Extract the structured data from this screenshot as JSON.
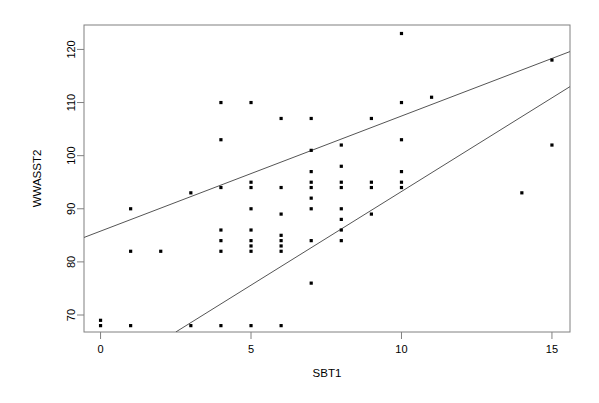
{
  "chart_data": {
    "type": "scatter",
    "title": "",
    "xlabel": "SBT1",
    "ylabel": "WWASST2",
    "xlim": [
      -0.55,
      15.6
    ],
    "ylim": [
      66.8,
      124.6
    ],
    "xticks": [
      0,
      5,
      10,
      15
    ],
    "yticks": [
      70,
      80,
      90,
      100,
      110,
      120
    ],
    "xtick_labels": [
      "0",
      "5",
      "10",
      "15"
    ],
    "ytick_labels": [
      "70",
      "80",
      "90",
      "100",
      "110",
      "120"
    ],
    "grid": false,
    "legend": null,
    "frame": "box",
    "point_symbol": "filled-square-small",
    "point_color": "#000000",
    "line_color": "#555555",
    "x": [
      0,
      0,
      1,
      1,
      1,
      2,
      3,
      3,
      4,
      4,
      4,
      4,
      4,
      4,
      4,
      5,
      5,
      5,
      5,
      5,
      5,
      5,
      5,
      5,
      6,
      6,
      6,
      6,
      6,
      6,
      6,
      6,
      7,
      7,
      7,
      7,
      7,
      7,
      7,
      7,
      7,
      8,
      8,
      8,
      8,
      8,
      8,
      8,
      8,
      9,
      9,
      9,
      9,
      10,
      10,
      10,
      10,
      10,
      10,
      11,
      14,
      15,
      15
    ],
    "y": [
      69,
      68,
      90,
      82,
      68,
      82,
      93,
      68,
      110,
      103,
      94,
      86,
      84,
      82,
      68,
      110,
      95,
      94,
      90,
      86,
      84,
      83,
      82,
      68,
      107,
      94,
      89,
      85,
      84,
      83,
      82,
      68,
      107,
      101,
      97,
      95,
      94,
      92,
      90,
      84,
      76,
      102,
      98,
      95,
      94,
      90,
      88,
      86,
      84,
      107,
      95,
      94,
      89,
      123,
      110,
      103,
      97,
      95,
      94,
      111,
      93,
      118,
      102
    ],
    "series": [
      {
        "name": "points",
        "type": "scatter",
        "points": [
          {
            "x": 0,
            "y": 69
          },
          {
            "x": 0,
            "y": 68
          },
          {
            "x": 1,
            "y": 90
          },
          {
            "x": 1,
            "y": 82
          },
          {
            "x": 1,
            "y": 68
          },
          {
            "x": 2,
            "y": 82
          },
          {
            "x": 3,
            "y": 93
          },
          {
            "x": 3,
            "y": 68
          },
          {
            "x": 4,
            "y": 110
          },
          {
            "x": 4,
            "y": 103
          },
          {
            "x": 4,
            "y": 94
          },
          {
            "x": 4,
            "y": 86
          },
          {
            "x": 4,
            "y": 84
          },
          {
            "x": 4,
            "y": 82
          },
          {
            "x": 4,
            "y": 68
          },
          {
            "x": 5,
            "y": 110
          },
          {
            "x": 5,
            "y": 95
          },
          {
            "x": 5,
            "y": 94
          },
          {
            "x": 5,
            "y": 90
          },
          {
            "x": 5,
            "y": 86
          },
          {
            "x": 5,
            "y": 84
          },
          {
            "x": 5,
            "y": 83
          },
          {
            "x": 5,
            "y": 82
          },
          {
            "x": 5,
            "y": 68
          },
          {
            "x": 6,
            "y": 107
          },
          {
            "x": 6,
            "y": 94
          },
          {
            "x": 6,
            "y": 89
          },
          {
            "x": 6,
            "y": 85
          },
          {
            "x": 6,
            "y": 84
          },
          {
            "x": 6,
            "y": 83
          },
          {
            "x": 6,
            "y": 82
          },
          {
            "x": 6,
            "y": 68
          },
          {
            "x": 7,
            "y": 107
          },
          {
            "x": 7,
            "y": 101
          },
          {
            "x": 7,
            "y": 97
          },
          {
            "x": 7,
            "y": 95
          },
          {
            "x": 7,
            "y": 94
          },
          {
            "x": 7,
            "y": 92
          },
          {
            "x": 7,
            "y": 90
          },
          {
            "x": 7,
            "y": 84
          },
          {
            "x": 7,
            "y": 76
          },
          {
            "x": 8,
            "y": 102
          },
          {
            "x": 8,
            "y": 98
          },
          {
            "x": 8,
            "y": 95
          },
          {
            "x": 8,
            "y": 94
          },
          {
            "x": 8,
            "y": 90
          },
          {
            "x": 8,
            "y": 88
          },
          {
            "x": 8,
            "y": 86
          },
          {
            "x": 8,
            "y": 84
          },
          {
            "x": 9,
            "y": 107
          },
          {
            "x": 9,
            "y": 95
          },
          {
            "x": 9,
            "y": 94
          },
          {
            "x": 9,
            "y": 89
          },
          {
            "x": 10,
            "y": 123
          },
          {
            "x": 10,
            "y": 110
          },
          {
            "x": 10,
            "y": 103
          },
          {
            "x": 10,
            "y": 97
          },
          {
            "x": 10,
            "y": 95
          },
          {
            "x": 10,
            "y": 94
          },
          {
            "x": 11,
            "y": 111
          },
          {
            "x": 14,
            "y": 93
          },
          {
            "x": 15,
            "y": 118
          },
          {
            "x": 15,
            "y": 102
          }
        ]
      },
      {
        "name": "upper-fit-line",
        "type": "line",
        "x_start": -0.55,
        "y_start": 84.6,
        "x_end": 15.6,
        "y_end": 119.6
      },
      {
        "name": "lower-fit-line",
        "type": "line",
        "x_start": 2.5,
        "y_start": 66.8,
        "x_end": 15.6,
        "y_end": 113.0
      }
    ]
  }
}
